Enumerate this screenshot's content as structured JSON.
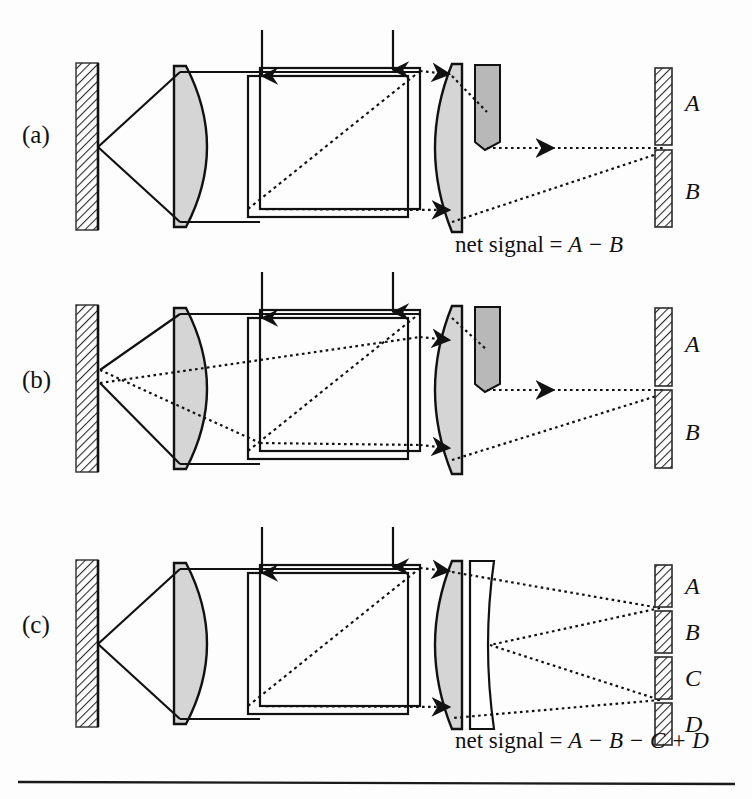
{
  "figure": {
    "background_color": "#fdfdfd",
    "ink_color": "#111111",
    "lens_fill": "#d5d5d5",
    "prism_fill": "#b8b8b8",
    "plate_fill": "#ffffff",
    "hatch_color": "#2b2b2b",
    "width": 752,
    "height": 799
  },
  "panels": [
    {
      "id": "panel-a",
      "label": "(a)",
      "label_x": 22,
      "label_y": 143,
      "condition": "in focus",
      "net_signal_prefix": "net signal = ",
      "net_signal_expression": "A − B",
      "net_signal_x": 455,
      "net_signal_y": 252,
      "detector": {
        "type": "bi-cell",
        "segments": [
          {
            "label": "A",
            "x": 655,
            "y": 68,
            "w": 17,
            "h": 77,
            "label_x": 685,
            "label_y": 111
          },
          {
            "label": "B",
            "x": 655,
            "y": 150,
            "w": 17,
            "h": 77,
            "label_x": 685,
            "label_y": 199
          }
        ]
      },
      "elements": [
        "mirror",
        "objective-lens",
        "beam-splitter-cube",
        "collector-lens",
        "knife-edge-prism",
        "bi-cell-detector"
      ]
    },
    {
      "id": "panel-b",
      "label": "(b)",
      "label_x": 22,
      "label_y": 388,
      "condition": "defocused",
      "net_signal_prefix": "",
      "net_signal_expression": "",
      "detector": {
        "type": "bi-cell",
        "segments": [
          {
            "label": "A",
            "x": 655,
            "y": 308,
            "w": 17,
            "h": 78,
            "label_x": 685,
            "label_y": 352
          },
          {
            "label": "B",
            "x": 655,
            "y": 390,
            "w": 17,
            "h": 78,
            "label_x": 685,
            "label_y": 440
          }
        ]
      },
      "elements": [
        "mirror",
        "objective-lens",
        "beam-splitter-cube",
        "collector-lens",
        "knife-edge-prism",
        "bi-cell-detector"
      ]
    },
    {
      "id": "panel-c",
      "label": "(c)",
      "label_x": 22,
      "label_y": 633,
      "condition": "astigmatic",
      "net_signal_prefix": "net signal = ",
      "net_signal_expression": "A − B − C + D",
      "net_signal_x": 455,
      "net_signal_y": 748,
      "detector": {
        "type": "quadrant",
        "segments": [
          {
            "label": "A",
            "x": 655,
            "y": 565,
            "w": 17,
            "h": 42,
            "label_x": 685,
            "label_y": 594
          },
          {
            "label": "B",
            "x": 655,
            "y": 611,
            "w": 17,
            "h": 42,
            "label_x": 685,
            "label_y": 640
          },
          {
            "label": "C",
            "x": 655,
            "y": 657,
            "w": 17,
            "h": 42,
            "label_x": 685,
            "label_y": 686
          },
          {
            "label": "D",
            "x": 655,
            "y": 703,
            "w": 17,
            "h": 42,
            "label_x": 685,
            "label_y": 732
          }
        ]
      },
      "elements": [
        "mirror",
        "objective-lens",
        "beam-splitter-cube",
        "collector-lens",
        "cylindrical-lens",
        "quadrant-detector"
      ]
    }
  ],
  "annotations": {
    "incoming_beam_arrow_count": 2,
    "arrow_x_positions": [
      262,
      393
    ],
    "caption_rule": true
  }
}
